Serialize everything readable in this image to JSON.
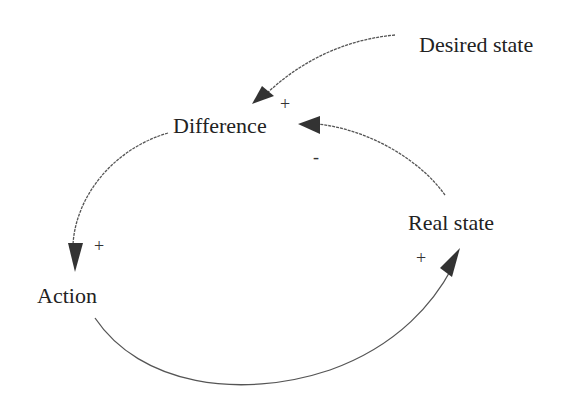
{
  "diagram": {
    "type": "causal-loop",
    "nodes": {
      "desired_state": "Desired state",
      "difference": "Difference",
      "action": "Action",
      "real_state": "Real state"
    },
    "links": [
      {
        "from": "Desired state",
        "to": "Difference",
        "polarity": "+"
      },
      {
        "from": "Real state",
        "to": "Difference",
        "polarity": "-"
      },
      {
        "from": "Difference",
        "to": "Action",
        "polarity": "+"
      },
      {
        "from": "Action",
        "to": "Real state",
        "polarity": "+"
      }
    ],
    "polarities": {
      "desired_to_difference": "+",
      "real_to_difference": "-",
      "difference_to_action": "+",
      "action_to_real": "+"
    },
    "colors": {
      "line": "#555555",
      "arrow": "#333333",
      "text": "#222222"
    }
  }
}
